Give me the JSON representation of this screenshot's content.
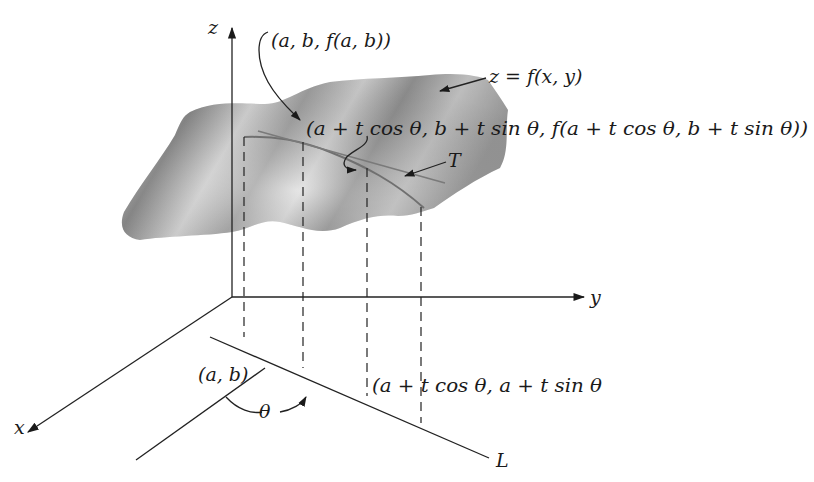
{
  "figure": {
    "axes": {
      "z_label": "z",
      "y_label": "y",
      "x_label": "x"
    },
    "labels": {
      "surface": "z = f(x, y)",
      "point_on_surface": "(a, b, f(a, b))",
      "moved_point_on_surface": "(a + t cos θ, b + t sin θ, f(a + t cos θ, b + t sin θ))",
      "tangent": "T",
      "base_point": "(a, b)",
      "moved_base_point": "(a + t cos θ, a + t sin θ",
      "angle": "θ",
      "line": "L"
    },
    "colors": {
      "ink": "#1a1a1a",
      "surface_dark": "#8c8c8c",
      "surface_light": "#e6e6e6",
      "curve": "#6e6e6e"
    }
  }
}
